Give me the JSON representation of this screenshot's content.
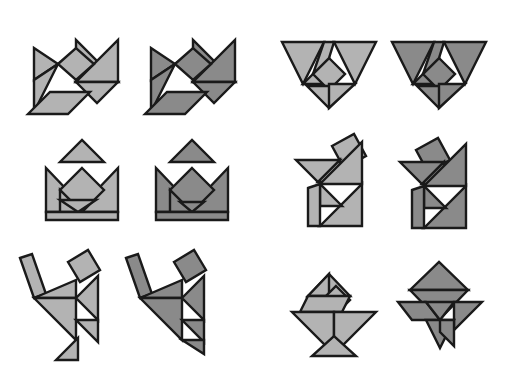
{
  "page": {
    "background_color": "#ffffff",
    "width": 506,
    "height": 372,
    "columns": 4,
    "rows": 3,
    "pair_count": 6,
    "figure_count": 12
  },
  "palette": {
    "light_fill": "#b3b3b3",
    "dark_fill": "#8a8a8a",
    "outline": "#1a1a1a",
    "background": "#ffffff"
  },
  "piece_names": [
    "large-triangle-1",
    "large-triangle-2",
    "medium-triangle",
    "small-triangle-1",
    "small-triangle-2",
    "square",
    "parallelogram"
  ],
  "figures": [
    {
      "id": "fish-light",
      "label": "Fish",
      "variant": "light",
      "row": 1,
      "column": 1,
      "x": 14,
      "y": 12,
      "width": 120,
      "height": 110,
      "fill": "#b3b3b3",
      "pieces": [
        {
          "name": "large-triangle-1",
          "points": "62,28 62,70 104,70"
        },
        {
          "name": "large-triangle-2",
          "points": "104,28 104,70 62,70"
        },
        {
          "name": "medium-triangle",
          "points": "62,70 104,70 83,91"
        },
        {
          "name": "small-triangle-1",
          "points": "20,36 20,68 44,52"
        },
        {
          "name": "small-triangle-2",
          "points": "20,68 20,100 44,52"
        },
        {
          "name": "square",
          "points": "44,52 62,36 80,52 62,68"
        },
        {
          "name": "parallelogram",
          "points": "14,102 36,80 76,80 54,102"
        }
      ]
    },
    {
      "id": "fish-dark",
      "label": "Fish",
      "variant": "dark",
      "row": 1,
      "column": 2,
      "x": 131,
      "y": 12,
      "width": 120,
      "height": 110,
      "fill": "#8a8a8a",
      "pieces": [
        {
          "name": "large-triangle-1",
          "points": "62,28 62,70 104,70"
        },
        {
          "name": "large-triangle-2",
          "points": "104,28 104,70 62,70"
        },
        {
          "name": "medium-triangle",
          "points": "62,70 104,70 83,91"
        },
        {
          "name": "small-triangle-1",
          "points": "20,36 20,68 44,52"
        },
        {
          "name": "small-triangle-2",
          "points": "20,68 20,100 44,52"
        },
        {
          "name": "square",
          "points": "44,52 62,36 80,52 62,68"
        },
        {
          "name": "parallelogram",
          "points": "14,102 36,80 76,80 54,102"
        }
      ]
    },
    {
      "id": "boat-light",
      "label": "Boat",
      "variant": "light",
      "row": 1,
      "column": 3,
      "x": 276,
      "y": 28,
      "width": 108,
      "height": 80,
      "fill": "#b3b3b3",
      "pieces": [
        {
          "name": "large-triangle-1",
          "points": "6,14 48,14 27,56"
        },
        {
          "name": "large-triangle-2",
          "points": "58,14 100,14 79,56"
        },
        {
          "name": "medium-triangle",
          "points": "27,56 53,30 53,56"
        },
        {
          "name": "square",
          "points": "53,30 69,46 53,62 37,46"
        },
        {
          "name": "small-triangle-1",
          "points": "31,58 75,58 53,80"
        },
        {
          "name": "small-triangle-2",
          "points": "53,56 79,56 53,80"
        },
        {
          "name": "parallelogram",
          "points": "48,14 58,14 53,30 37,46"
        }
      ]
    },
    {
      "id": "boat-dark",
      "label": "Boat",
      "variant": "dark",
      "row": 1,
      "column": 4,
      "x": 386,
      "y": 28,
      "width": 108,
      "height": 80,
      "fill": "#8a8a8a",
      "pieces": [
        {
          "name": "large-triangle-1",
          "points": "6,14 48,14 27,56"
        },
        {
          "name": "large-triangle-2",
          "points": "58,14 100,14 79,56"
        },
        {
          "name": "medium-triangle",
          "points": "27,56 53,30 53,56"
        },
        {
          "name": "square",
          "points": "53,30 69,46 53,62 37,46"
        },
        {
          "name": "small-triangle-1",
          "points": "31,58 75,58 53,80"
        },
        {
          "name": "small-triangle-2",
          "points": "53,56 79,56 53,80"
        },
        {
          "name": "parallelogram",
          "points": "48,14 58,14 53,30 37,46"
        }
      ]
    },
    {
      "id": "vase-light",
      "label": "Vase",
      "variant": "light",
      "row": 2,
      "column": 1,
      "x": 38,
      "y": 128,
      "width": 88,
      "height": 92,
      "fill": "#b3b3b3",
      "pieces": [
        {
          "name": "small-triangle-1",
          "points": "22,34 66,34 44,12"
        },
        {
          "name": "large-triangle-1",
          "points": "8,40 8,84 50,84"
        },
        {
          "name": "large-triangle-2",
          "points": "80,40 80,84 38,84"
        },
        {
          "name": "square",
          "points": "44,40 66,62 44,84 22,62"
        },
        {
          "name": "medium-triangle",
          "points": "22,62 44,84 22,84"
        },
        {
          "name": "small-triangle-2",
          "points": "22,72 58,72 40,84"
        },
        {
          "name": "parallelogram",
          "points": "8,84 80,84 80,92 8,92"
        }
      ]
    },
    {
      "id": "vase-dark",
      "label": "Vase",
      "variant": "dark",
      "row": 2,
      "column": 2,
      "x": 148,
      "y": 128,
      "width": 88,
      "height": 92,
      "fill": "#8a8a8a",
      "pieces": [
        {
          "name": "small-triangle-1",
          "points": "22,34 66,34 44,12"
        },
        {
          "name": "large-triangle-1",
          "points": "8,40 8,84 50,84"
        },
        {
          "name": "large-triangle-2",
          "points": "80,40 80,84 38,84"
        },
        {
          "name": "square",
          "points": "44,40 66,62 44,84 22,62"
        },
        {
          "name": "medium-triangle",
          "points": "22,62 44,84 22,84"
        },
        {
          "name": "small-triangle-2",
          "points": "32,74 56,74 44,84"
        },
        {
          "name": "parallelogram",
          "points": "8,84 80,84 80,92 8,92"
        }
      ]
    },
    {
      "id": "cat-light",
      "label": "Cat",
      "variant": "light",
      "row": 2,
      "column": 3,
      "x": 288,
      "y": 126,
      "width": 92,
      "height": 106,
      "fill": "#b3b3b3",
      "pieces": [
        {
          "name": "square",
          "points": "44,20 66,8 78,30 56,42"
        },
        {
          "name": "small-triangle-1",
          "points": "8,34 52,34 30,56"
        },
        {
          "name": "medium-triangle",
          "points": "30,56 52,34 52,56"
        },
        {
          "name": "large-triangle-1",
          "points": "74,16 74,58 32,58"
        },
        {
          "name": "large-triangle-2",
          "points": "74,58 74,100 32,100"
        },
        {
          "name": "small-triangle-2",
          "points": "32,58 32,80 54,80"
        },
        {
          "name": "parallelogram",
          "points": "20,62 32,58 32,100 20,100"
        }
      ]
    },
    {
      "id": "cat-dark",
      "label": "Cat",
      "variant": "dark",
      "row": 2,
      "column": 4,
      "x": 394,
      "y": 126,
      "width": 92,
      "height": 106,
      "fill": "#8a8a8a",
      "pieces": [
        {
          "name": "square",
          "points": "22,24 44,12 56,34 34,46"
        },
        {
          "name": "small-triangle-1",
          "points": "6,36 50,36 28,58"
        },
        {
          "name": "medium-triangle",
          "points": "28,58 50,36 50,58"
        },
        {
          "name": "large-triangle-1",
          "points": "72,18 72,60 30,60"
        },
        {
          "name": "large-triangle-2",
          "points": "72,60 72,102 30,102"
        },
        {
          "name": "small-triangle-2",
          "points": "30,60 30,82 52,82"
        },
        {
          "name": "parallelogram",
          "points": "18,64 30,60 30,102 18,102"
        }
      ]
    },
    {
      "id": "dancer-light",
      "label": "Dancer",
      "variant": "light",
      "row": 3,
      "column": 1,
      "x": 12,
      "y": 242,
      "width": 92,
      "height": 124,
      "fill": "#b3b3b3",
      "pieces": [
        {
          "name": "square",
          "points": "56,20 76,8 88,28 68,40"
        },
        {
          "name": "parallelogram",
          "points": "8,16 20,12 34,52 22,56"
        },
        {
          "name": "medium-triangle",
          "points": "22,56 64,56 64,38"
        },
        {
          "name": "large-triangle-1",
          "points": "22,56 64,98 64,56"
        },
        {
          "name": "large-triangle-2",
          "points": "64,56 86,34 86,78"
        },
        {
          "name": "small-triangle-1",
          "points": "64,78 86,78 86,100"
        },
        {
          "name": "small-triangle-2",
          "points": "44,118 66,96 66,118"
        }
      ]
    },
    {
      "id": "dancer-dark",
      "label": "Dancer",
      "variant": "dark",
      "row": 3,
      "column": 2,
      "x": 118,
      "y": 242,
      "width": 92,
      "height": 124,
      "fill": "#8a8a8a",
      "pieces": [
        {
          "name": "square",
          "points": "56,20 76,8 88,28 68,40"
        },
        {
          "name": "parallelogram",
          "points": "8,16 20,12 34,52 22,56"
        },
        {
          "name": "medium-triangle",
          "points": "22,56 64,56 64,38"
        },
        {
          "name": "large-triangle-1",
          "points": "22,56 64,98 64,56"
        },
        {
          "name": "large-triangle-2",
          "points": "64,56 86,34 86,78"
        },
        {
          "name": "small-triangle-1",
          "points": "64,78 86,78 86,100"
        },
        {
          "name": "small-triangle-2",
          "points": "64,98 86,98 86,112"
        }
      ]
    },
    {
      "id": "rocket-light",
      "label": "Rocket",
      "variant": "light",
      "row": 3,
      "column": 3,
      "x": 286,
      "y": 256,
      "width": 96,
      "height": 104,
      "fill": "#b3b3b3",
      "pieces": [
        {
          "name": "medium-triangle",
          "points": "22,40 64,40 43,18"
        },
        {
          "name": "small-triangle-1",
          "points": "22,40 43,18 43,40"
        },
        {
          "name": "square",
          "points": "50,30 64,44 50,58 36,44"
        },
        {
          "name": "parallelogram",
          "points": "22,40 64,40 56,56 14,56"
        },
        {
          "name": "large-triangle-1",
          "points": "6,56 48,56 48,98"
        },
        {
          "name": "large-triangle-2",
          "points": "48,56 90,56 48,98"
        },
        {
          "name": "small-triangle-2",
          "points": "26,100 70,100 48,80"
        }
      ]
    },
    {
      "id": "rocket-dark",
      "label": "Rocket",
      "variant": "dark",
      "row": 3,
      "column": 4,
      "x": 392,
      "y": 256,
      "width": 96,
      "height": 104,
      "fill": "#8a8a8a",
      "pieces": [
        {
          "name": "large-triangle-1",
          "points": "18,34 76,34 47,6"
        },
        {
          "name": "large-triangle-2",
          "points": "18,34 76,34 47,64"
        },
        {
          "name": "parallelogram",
          "points": "6,46 34,46 48,64 20,64"
        },
        {
          "name": "medium-triangle",
          "points": "62,46 90,46 62,74"
        },
        {
          "name": "small-triangle-1",
          "points": "34,46 62,46 48,64"
        },
        {
          "name": "small-triangle-2",
          "points": "34,64 62,64 48,92"
        },
        {
          "name": "square",
          "points": "48,64 62,64 62,90 48,76"
        }
      ]
    }
  ]
}
